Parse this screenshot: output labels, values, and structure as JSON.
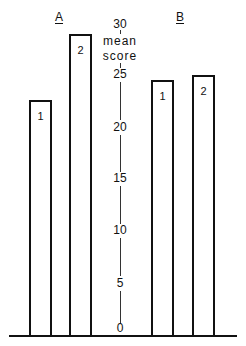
{
  "chart_data": {
    "type": "bar",
    "title": "",
    "xlabel": "",
    "ylabel": "mean score",
    "ylim": [
      0,
      30
    ],
    "yticks": [
      0,
      5,
      10,
      15,
      20,
      25,
      30
    ],
    "grid": false,
    "legend": null,
    "groups": [
      {
        "name": "A",
        "categories": [
          "1",
          "2"
        ],
        "values": [
          23,
          29.5
        ]
      },
      {
        "name": "B",
        "categories": [
          "1",
          "2"
        ],
        "values": [
          25,
          25.5
        ]
      }
    ],
    "series": [
      {
        "name": "1",
        "values": [
          23,
          25
        ]
      },
      {
        "name": "2",
        "values": [
          29.5,
          25.5
        ]
      }
    ],
    "categories": [
      "A",
      "B"
    ]
  },
  "labels": {
    "group_a": "A",
    "group_b": "B",
    "axis_title_line1": "mean",
    "axis_title_line2": "score",
    "bar_a1": "1",
    "bar_a2": "2",
    "bar_b1": "1",
    "bar_b2": "2",
    "ticks": [
      "0",
      "5",
      "10",
      "15",
      "20",
      "25",
      "30"
    ]
  }
}
